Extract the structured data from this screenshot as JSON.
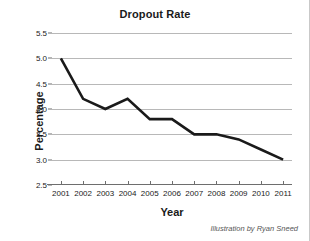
{
  "credit": "Illustration by Ryan Sneed",
  "colors": {
    "line": "#1a1a1a",
    "grid": "#b8b8b8",
    "axis": "#6e6e6e",
    "text": "#1a1a1a",
    "background": "#ffffff"
  },
  "chart_data": {
    "type": "line",
    "title": "Dropout Rate",
    "xlabel": "Year",
    "ylabel": "Percentage",
    "categories": [
      "2001",
      "2002",
      "2003",
      "2004",
      "2005",
      "2006",
      "2007",
      "2008",
      "2009",
      "2010",
      "2011"
    ],
    "x": [
      2001,
      2002,
      2003,
      2004,
      2005,
      2006,
      2007,
      2008,
      2009,
      2010,
      2011
    ],
    "values": [
      5.0,
      4.2,
      4.0,
      4.2,
      3.8,
      3.8,
      3.5,
      3.5,
      3.4,
      3.2,
      3.0
    ],
    "series": [
      {
        "name": "Dropout Rate",
        "values": [
          5.0,
          4.2,
          4.0,
          4.2,
          3.8,
          3.8,
          3.5,
          3.5,
          3.4,
          3.2,
          3.0
        ]
      }
    ],
    "ylim": [
      2.5,
      5.5
    ],
    "yticks": [
      2.5,
      3.0,
      3.5,
      4.0,
      4.5,
      5.0,
      5.5
    ],
    "ytick_labels": [
      "2.5",
      "3.0",
      "3.5",
      "4.0",
      "4.5",
      "5.0",
      "5.5"
    ],
    "xlim": [
      2000.6,
      2011.4
    ],
    "grid": true,
    "legend": false,
    "markers": false
  }
}
